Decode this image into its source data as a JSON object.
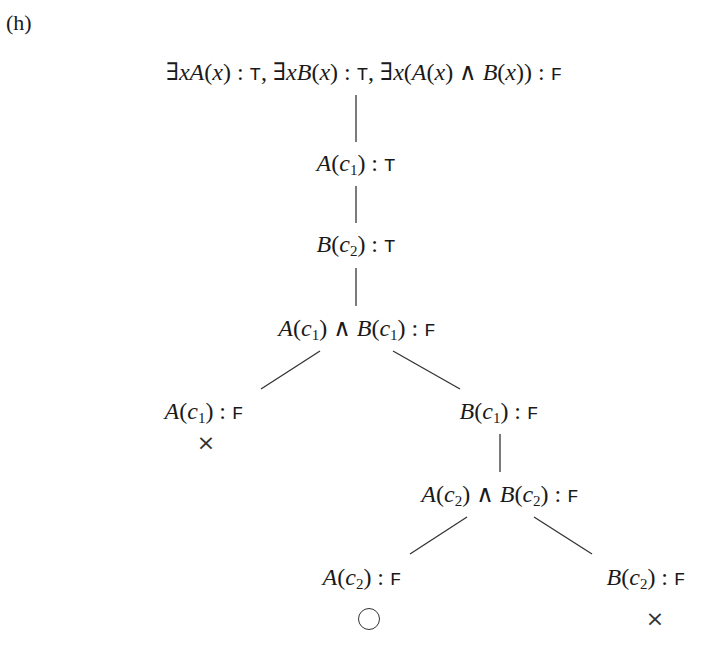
{
  "figure_label": "(h)",
  "tree": {
    "root": {
      "id": "root",
      "x": 364,
      "y": 72,
      "parts": [
        {
          "t": "∃",
          "s": "r"
        },
        {
          "t": "x",
          "s": "m"
        },
        {
          "t": "A",
          "s": "m"
        },
        {
          "t": "(",
          "s": "r"
        },
        {
          "t": "x",
          "s": "m"
        },
        {
          "t": ") : ",
          "s": "r"
        },
        {
          "t": "T",
          "s": "tt"
        },
        {
          "t": ", ∃",
          "s": "r"
        },
        {
          "t": "x",
          "s": "m"
        },
        {
          "t": "B",
          "s": "m"
        },
        {
          "t": "(",
          "s": "r"
        },
        {
          "t": "x",
          "s": "m"
        },
        {
          "t": ") : ",
          "s": "r"
        },
        {
          "t": "T",
          "s": "tt"
        },
        {
          "t": ", ∃",
          "s": "r"
        },
        {
          "t": "x",
          "s": "m"
        },
        {
          "t": "(",
          "s": "r"
        },
        {
          "t": "A",
          "s": "m"
        },
        {
          "t": "(",
          "s": "r"
        },
        {
          "t": "x",
          "s": "m"
        },
        {
          "t": ") ∧ ",
          "s": "r"
        },
        {
          "t": "B",
          "s": "m"
        },
        {
          "t": "(",
          "s": "r"
        },
        {
          "t": "x",
          "s": "m"
        },
        {
          "t": ")) : ",
          "s": "r"
        },
        {
          "t": "F",
          "s": "tt"
        }
      ],
      "text": "∃xA(x) : T, ∃xB(x) : T, ∃x(A(x) ∧ B(x)) : F"
    },
    "nodes": [
      {
        "id": "n1",
        "text": "A(c1) : T",
        "x": 356,
        "y": 164,
        "parts": [
          {
            "t": "A",
            "s": "m"
          },
          {
            "t": "(",
            "s": "r"
          },
          {
            "t": "c",
            "s": "m"
          },
          {
            "t": "1",
            "s": "sub"
          },
          {
            "t": ") : ",
            "s": "r"
          },
          {
            "t": "T",
            "s": "tt"
          }
        ]
      },
      {
        "id": "n2",
        "text": "B(c2) : T",
        "x": 356,
        "y": 245,
        "parts": [
          {
            "t": "B",
            "s": "m"
          },
          {
            "t": "(",
            "s": "r"
          },
          {
            "t": "c",
            "s": "m"
          },
          {
            "t": "2",
            "s": "sub"
          },
          {
            "t": ") : ",
            "s": "r"
          },
          {
            "t": "T",
            "s": "tt"
          }
        ]
      },
      {
        "id": "n3",
        "text": "A(c1) ∧ B(c1) : F",
        "x": 357,
        "y": 329,
        "parts": [
          {
            "t": "A",
            "s": "m"
          },
          {
            "t": "(",
            "s": "r"
          },
          {
            "t": "c",
            "s": "m"
          },
          {
            "t": "1",
            "s": "sub"
          },
          {
            "t": ") ∧ ",
            "s": "r"
          },
          {
            "t": "B",
            "s": "m"
          },
          {
            "t": "(",
            "s": "r"
          },
          {
            "t": "c",
            "s": "m"
          },
          {
            "t": "1",
            "s": "sub"
          },
          {
            "t": ") : ",
            "s": "r"
          },
          {
            "t": "F",
            "s": "tt"
          }
        ]
      },
      {
        "id": "n4",
        "text": "A(c1) : F",
        "x": 204,
        "y": 412,
        "parts": [
          {
            "t": "A",
            "s": "m"
          },
          {
            "t": "(",
            "s": "r"
          },
          {
            "t": "c",
            "s": "m"
          },
          {
            "t": "1",
            "s": "sub"
          },
          {
            "t": ") : ",
            "s": "r"
          },
          {
            "t": "F",
            "s": "tt"
          }
        ]
      },
      {
        "id": "n5",
        "text": "B(c1) : F",
        "x": 499,
        "y": 412,
        "parts": [
          {
            "t": "B",
            "s": "m"
          },
          {
            "t": "(",
            "s": "r"
          },
          {
            "t": "c",
            "s": "m"
          },
          {
            "t": "1",
            "s": "sub"
          },
          {
            "t": ") : ",
            "s": "r"
          },
          {
            "t": "F",
            "s": "tt"
          }
        ]
      },
      {
        "id": "n6",
        "text": "A(c2) ∧ B(c2) : F",
        "x": 500,
        "y": 495,
        "parts": [
          {
            "t": "A",
            "s": "m"
          },
          {
            "t": "(",
            "s": "r"
          },
          {
            "t": "c",
            "s": "m"
          },
          {
            "t": "2",
            "s": "sub"
          },
          {
            "t": ") ∧ ",
            "s": "r"
          },
          {
            "t": "B",
            "s": "m"
          },
          {
            "t": "(",
            "s": "r"
          },
          {
            "t": "c",
            "s": "m"
          },
          {
            "t": "2",
            "s": "sub"
          },
          {
            "t": ") : ",
            "s": "r"
          },
          {
            "t": "F",
            "s": "tt"
          }
        ]
      },
      {
        "id": "n7",
        "text": "A(c2) : F",
        "x": 362,
        "y": 578,
        "parts": [
          {
            "t": "A",
            "s": "m"
          },
          {
            "t": "(",
            "s": "r"
          },
          {
            "t": "c",
            "s": "m"
          },
          {
            "t": "2",
            "s": "sub"
          },
          {
            "t": ") : ",
            "s": "r"
          },
          {
            "t": "F",
            "s": "tt"
          }
        ]
      },
      {
        "id": "n8",
        "text": "B(c2) : F",
        "x": 646,
        "y": 578,
        "parts": [
          {
            "t": "B",
            "s": "m"
          },
          {
            "t": "(",
            "s": "r"
          },
          {
            "t": "c",
            "s": "m"
          },
          {
            "t": "2",
            "s": "sub"
          },
          {
            "t": ") : ",
            "s": "r"
          },
          {
            "t": "F",
            "s": "tt"
          }
        ]
      }
    ],
    "edges": [
      {
        "from": "root",
        "to": "n1",
        "x1": 356,
        "y1": 95,
        "x2": 356,
        "y2": 142
      },
      {
        "from": "n1",
        "to": "n2",
        "x1": 356,
        "y1": 186,
        "x2": 356,
        "y2": 223
      },
      {
        "from": "n2",
        "to": "n3",
        "x1": 356,
        "y1": 268,
        "x2": 356,
        "y2": 306
      },
      {
        "from": "n3",
        "to": "n4",
        "x1": 320,
        "y1": 351,
        "x2": 261,
        "y2": 389
      },
      {
        "from": "n3",
        "to": "n5",
        "x1": 393,
        "y1": 351,
        "x2": 460,
        "y2": 389
      },
      {
        "from": "n5",
        "to": "n6",
        "x1": 500,
        "y1": 434,
        "x2": 500,
        "y2": 472
      },
      {
        "from": "n6",
        "to": "n7",
        "x1": 467,
        "y1": 517,
        "x2": 410,
        "y2": 554
      },
      {
        "from": "n6",
        "to": "n8",
        "x1": 534,
        "y1": 517,
        "x2": 592,
        "y2": 554
      }
    ],
    "marks": [
      {
        "id": "m1",
        "under": "n4",
        "symbol": "×",
        "meaning": "closed",
        "x": 206,
        "y": 443
      },
      {
        "id": "m2",
        "under": "n7",
        "symbol": "○",
        "meaning": "open",
        "x": 369,
        "y": 619
      },
      {
        "id": "m3",
        "under": "n8",
        "symbol": "×",
        "meaning": "closed",
        "x": 655,
        "y": 619
      }
    ]
  },
  "colors": {
    "ink": "#1a1a1a",
    "line": "#333333",
    "background": "#ffffff"
  }
}
